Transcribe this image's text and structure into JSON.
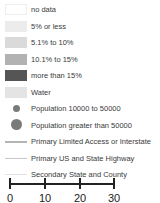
{
  "legend": {
    "items": [
      {
        "label": "no data",
        "type": "swatch",
        "color": "#ffffff",
        "border": "#eeeeee"
      },
      {
        "label": "5% or less",
        "type": "swatch",
        "color": "#ececec"
      },
      {
        "label": "5.1% to 10%",
        "type": "swatch",
        "color": "#dadada"
      },
      {
        "label": "10.1% to 15%",
        "type": "swatch",
        "color": "#b2b2b2"
      },
      {
        "label": "more than 15%",
        "type": "swatch",
        "color": "#555555"
      },
      {
        "label": "Water",
        "type": "swatch",
        "color": "#e4e4e4"
      },
      {
        "label": "Population 10000 to 50000",
        "type": "dot-small",
        "color": "#7a7a7a"
      },
      {
        "label": "Population greater than 50000",
        "type": "dot-large",
        "color": "#7a7a7a"
      },
      {
        "label": "Primary Limited Access or Interstate",
        "type": "line-thick",
        "color": "#b4b4b4"
      },
      {
        "label": "Primary US and State Highway",
        "type": "line-medium",
        "color": "#c8c8c8"
      },
      {
        "label": "Secondary State and County",
        "type": "line-thin",
        "color": "#e2e2e2"
      }
    ]
  },
  "scale_bar": {
    "ticks": [
      "0",
      "10",
      "20",
      "30"
    ],
    "color": "#222222"
  }
}
